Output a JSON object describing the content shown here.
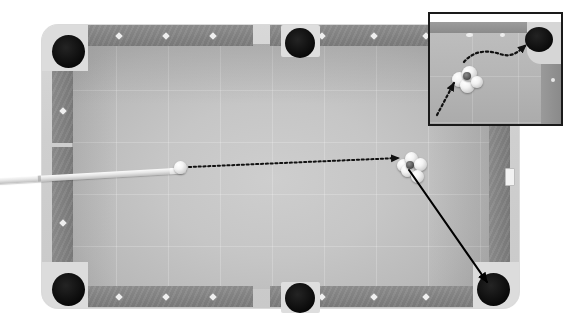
{
  "scene": {
    "title": "Pool Table Shot Diagram",
    "description": "Overhead view of a billiards table with a cue stick striking the cue ball toward a cluster of object balls; an inset magnifies the cluster and the path to the corner pocket.",
    "width": 587,
    "height": 330,
    "background_color": "#ffffff"
  },
  "table": {
    "frame_label": "table-frame",
    "frame_color": "#d8d8d8",
    "felt_label": "playing-surface",
    "felt_color": "#c6c6c6",
    "cushion_color": "#848484",
    "grid_visible": true,
    "grid_spacing_px": 52
  },
  "pockets": [
    {
      "id": "top-left",
      "label": "Top left corner pocket",
      "type": "corner",
      "color": "#000000"
    },
    {
      "id": "top-middle",
      "label": "Top side pocket",
      "type": "side",
      "color": "#000000"
    },
    {
      "id": "top-right",
      "label": "Top right corner pocket",
      "type": "corner",
      "color": "#000000"
    },
    {
      "id": "bottom-left",
      "label": "Bottom left corner pocket",
      "type": "corner",
      "color": "#000000"
    },
    {
      "id": "bottom-middle",
      "label": "Bottom side pocket",
      "type": "side",
      "color": "#000000"
    },
    {
      "id": "bottom-right",
      "label": "Bottom right corner pocket",
      "type": "corner",
      "color": "#000000"
    }
  ],
  "rail_diamonds": {
    "marker_color": "#efefef",
    "top_left_rail": [
      119,
      166,
      213
    ],
    "top_right_rail": [
      345,
      392,
      439
    ],
    "bottom_left_rail": [
      119,
      166,
      213
    ],
    "bottom_right_rail": [
      345,
      392,
      439
    ],
    "left_rail": [
      110,
      166,
      222
    ],
    "right_rail_marker": "white-rectangle-sight"
  },
  "cue": {
    "label": "Cue stick",
    "color": "#e6e6e6",
    "tip_color": "#ffffff",
    "angle_deg": -3.2
  },
  "balls": {
    "cue_ball": {
      "label": "Cue ball",
      "color": "#ffffff",
      "x": 180,
      "y": 167,
      "d": 13
    },
    "cluster_label": "Object ball cluster",
    "cluster_count": 5,
    "cluster_center": {
      "x": 410,
      "y": 166
    },
    "cluster_color": "#f4f4f4",
    "dark_ball_color": "#2e2e2e"
  },
  "trajectories": [
    {
      "id": "cue-to-cluster",
      "label": "Cue ball path to cluster",
      "style": "dotted",
      "color": "#111111",
      "arrowhead": true,
      "from": {
        "x": 188,
        "y": 167
      },
      "to": {
        "x": 402,
        "y": 158
      }
    },
    {
      "id": "cluster-to-bottom-right-pocket",
      "label": "Object ball path to bottom right pocket",
      "style": "solid",
      "color": "#000000",
      "arrowhead": true,
      "from": {
        "x": 412,
        "y": 172
      },
      "to": {
        "x": 489,
        "y": 284
      }
    }
  ],
  "inset": {
    "label": "Magnified view of cluster and corner pocket",
    "border_color": "#1a1a1a",
    "border_width": 2,
    "felt_color": "#b6b6b6",
    "pocket_label": "Corner pocket (magnified)",
    "trajectories": [
      {
        "id": "inset-incoming",
        "label": "Incoming cue ball path (magnified)",
        "style": "dotted",
        "color": "#111111",
        "arrowhead": true
      },
      {
        "id": "inset-to-pocket",
        "label": "Curved object ball path to pocket (magnified)",
        "style": "dotted",
        "color": "#111111",
        "arrowhead": true
      }
    ]
  }
}
